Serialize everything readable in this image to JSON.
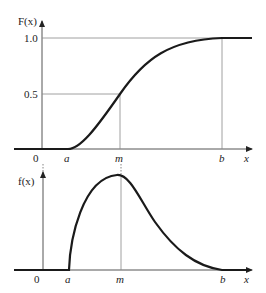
{
  "top_plot": {
    "y_label": "F(x)",
    "ticks_y": [
      "1.0",
      "0.5"
    ],
    "ticks_x": [
      "0",
      "a",
      "m",
      "b",
      "x"
    ],
    "description": "Cumulative distribution function of triangular-like skewed distribution"
  },
  "bottom_plot": {
    "y_label": "f(x)",
    "ticks_x": [
      "0",
      "a",
      "m",
      "b",
      "x"
    ],
    "description": "Probability density function, zero before a, peak at m, zero after b"
  },
  "colors": {
    "curve": "#1a1a1a",
    "guide": "#888888",
    "axis": "#555555"
  }
}
